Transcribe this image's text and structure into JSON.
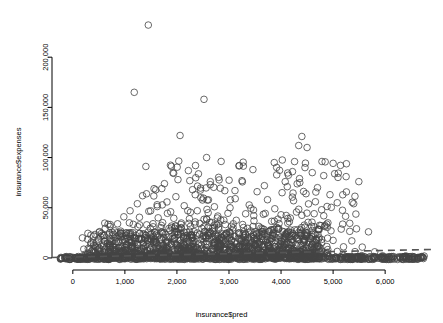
{
  "chart_data": {
    "type": "scatter",
    "title": "",
    "xlabel": "insurance$pred",
    "ylabel": "insurance$expenses",
    "xlim": [
      -400,
      6900
    ],
    "ylim": [
      -12000,
      245000
    ],
    "xticks": [
      0,
      1000,
      2000,
      3000,
      4000,
      5000,
      6000
    ],
    "xticklabels": [
      "0",
      "1,000",
      "2,000",
      "3,000",
      "4,000",
      "5,000",
      "6,000"
    ],
    "yticks": [
      0,
      50000,
      100000,
      150000,
      200000
    ],
    "yticklabels": [
      "0",
      "50,000",
      "100,000",
      "150,000",
      "200,000"
    ],
    "grid": false,
    "marker": "open-circle",
    "marker_color": "#444444",
    "marker_size": 4.6,
    "reference_line": {
      "style": "dashed",
      "color": "#555555",
      "x": [
        -400,
        6900
      ],
      "y": [
        500,
        8500
      ]
    },
    "baseline_band": {
      "description": "dense band of points at y near 0 spanning full x range",
      "y": 0
    },
    "points": [
      [
        1450,
        232000
      ],
      [
        1180,
        165000
      ],
      [
        2520,
        158000
      ],
      [
        2060,
        122000
      ],
      [
        4400,
        121000
      ],
      [
        4340,
        112000
      ],
      [
        4500,
        110000
      ],
      [
        2570,
        100000
      ],
      [
        4260,
        96000
      ],
      [
        3870,
        95000
      ],
      [
        4460,
        90000
      ],
      [
        3460,
        88000
      ],
      [
        2220,
        87000
      ],
      [
        4220,
        86000
      ],
      [
        4600,
        85000
      ],
      [
        4820,
        82000
      ],
      [
        5250,
        81000
      ],
      [
        2020,
        78000
      ],
      [
        3250,
        77000
      ],
      [
        4080,
        76000
      ],
      [
        4360,
        75000
      ],
      [
        1760,
        74000
      ],
      [
        2640,
        73000
      ],
      [
        3680,
        72000
      ],
      [
        4120,
        71000
      ],
      [
        4700,
        70000
      ],
      [
        1560,
        69000
      ],
      [
        2300,
        68000
      ],
      [
        2920,
        67000
      ],
      [
        3540,
        66000
      ],
      [
        4020,
        65000
      ],
      [
        4480,
        64000
      ],
      [
        4940,
        63000
      ],
      [
        1340,
        62000
      ],
      [
        1980,
        61000
      ],
      [
        2460,
        60000
      ],
      [
        3120,
        59000
      ],
      [
        3740,
        58000
      ],
      [
        4240,
        57000
      ],
      [
        4660,
        56000
      ],
      [
        5080,
        55000
      ],
      [
        1240,
        54000
      ],
      [
        1620,
        53000
      ],
      [
        2140,
        52000
      ],
      [
        2720,
        51000
      ],
      [
        3020,
        50000
      ],
      [
        3420,
        49500
      ],
      [
        3880,
        49000
      ],
      [
        4340,
        48500
      ],
      [
        4780,
        48000
      ],
      [
        5180,
        47500
      ],
      [
        1100,
        47000
      ],
      [
        1460,
        46500
      ],
      [
        1880,
        46000
      ],
      [
        2260,
        45500
      ],
      [
        2600,
        45000
      ],
      [
        2980,
        44500
      ],
      [
        3320,
        44000
      ],
      [
        3660,
        43500
      ],
      [
        4000,
        43000
      ],
      [
        4400,
        42500
      ],
      [
        4820,
        42000
      ],
      [
        5240,
        41500
      ],
      [
        980,
        41000
      ],
      [
        1280,
        40500
      ],
      [
        1640,
        40000
      ],
      [
        1940,
        39500
      ],
      [
        2240,
        39000
      ],
      [
        2520,
        38500
      ],
      [
        2840,
        38000
      ],
      [
        3140,
        37500
      ],
      [
        3480,
        37000
      ],
      [
        3820,
        36500
      ],
      [
        4160,
        36000
      ],
      [
        4520,
        35500
      ],
      [
        4900,
        35000
      ],
      [
        5320,
        34500
      ],
      [
        860,
        34000
      ],
      [
        1160,
        33500
      ],
      [
        1420,
        33000
      ],
      [
        1700,
        32500
      ],
      [
        1980,
        32000
      ],
      [
        2260,
        31500
      ],
      [
        2520,
        31000
      ],
      [
        2800,
        30500
      ],
      [
        3080,
        30000
      ],
      [
        3360,
        29500
      ],
      [
        3640,
        29000
      ],
      [
        3940,
        28500
      ],
      [
        4260,
        28000
      ],
      [
        4600,
        27500
      ],
      [
        4960,
        27000
      ],
      [
        5320,
        26500
      ],
      [
        5680,
        26000
      ],
      [
        760,
        25500
      ],
      [
        1020,
        25000
      ],
      [
        1280,
        24500
      ],
      [
        1520,
        24000
      ],
      [
        1780,
        23500
      ],
      [
        2020,
        23000
      ],
      [
        2280,
        22500
      ],
      [
        2520,
        22000
      ],
      [
        2780,
        21500
      ],
      [
        3020,
        21000
      ],
      [
        3280,
        20500
      ],
      [
        3540,
        20000
      ],
      [
        3800,
        19500
      ],
      [
        4080,
        19000
      ],
      [
        4360,
        18500
      ],
      [
        4680,
        18000
      ],
      [
        5000,
        17500
      ],
      [
        5360,
        17000
      ],
      [
        620,
        16500
      ],
      [
        880,
        16200
      ],
      [
        1120,
        15900
      ],
      [
        1360,
        15600
      ],
      [
        1600,
        15300
      ],
      [
        1840,
        15000
      ],
      [
        2080,
        14700
      ],
      [
        2320,
        14400
      ],
      [
        2560,
        14100
      ],
      [
        2800,
        13800
      ],
      [
        3040,
        13500
      ],
      [
        3280,
        13200
      ],
      [
        3520,
        12900
      ],
      [
        3760,
        12600
      ],
      [
        4020,
        12300
      ],
      [
        4300,
        12000
      ],
      [
        4580,
        11700
      ],
      [
        4880,
        11400
      ],
      [
        5200,
        11100
      ],
      [
        5560,
        10800
      ],
      [
        480,
        10500
      ],
      [
        700,
        10300
      ],
      [
        920,
        10100
      ],
      [
        1140,
        9900
      ],
      [
        1360,
        9700
      ],
      [
        1580,
        9500
      ],
      [
        1800,
        9300
      ],
      [
        2020,
        9100
      ],
      [
        2240,
        8900
      ],
      [
        2460,
        8700
      ],
      [
        2680,
        8500
      ],
      [
        2900,
        8300
      ],
      [
        3120,
        8100
      ],
      [
        3340,
        7900
      ],
      [
        3560,
        7700
      ],
      [
        3780,
        7500
      ],
      [
        4000,
        7300
      ],
      [
        4240,
        7100
      ],
      [
        4500,
        6900
      ],
      [
        4780,
        6700
      ],
      [
        5080,
        6500
      ],
      [
        5420,
        6300
      ],
      [
        5800,
        6100
      ],
      [
        400,
        5900
      ],
      [
        600,
        5750
      ],
      [
        800,
        5600
      ],
      [
        1000,
        5450
      ],
      [
        1200,
        5300
      ],
      [
        1400,
        5150
      ],
      [
        1600,
        5000
      ],
      [
        1800,
        4850
      ],
      [
        2000,
        4700
      ],
      [
        2200,
        4550
      ],
      [
        2400,
        4400
      ],
      [
        2600,
        4250
      ],
      [
        2800,
        4100
      ],
      [
        3000,
        3950
      ],
      [
        3200,
        3800
      ],
      [
        3400,
        3650
      ],
      [
        3600,
        3500
      ],
      [
        3800,
        3350
      ],
      [
        4000,
        3200
      ],
      [
        4200,
        3050
      ],
      [
        4400,
        2900
      ],
      [
        4650,
        2750
      ],
      [
        4900,
        2600
      ],
      [
        5200,
        2450
      ],
      [
        5550,
        2300
      ],
      [
        5950,
        2150
      ],
      [
        6400,
        2000
      ],
      [
        6750,
        1900
      ]
    ]
  }
}
